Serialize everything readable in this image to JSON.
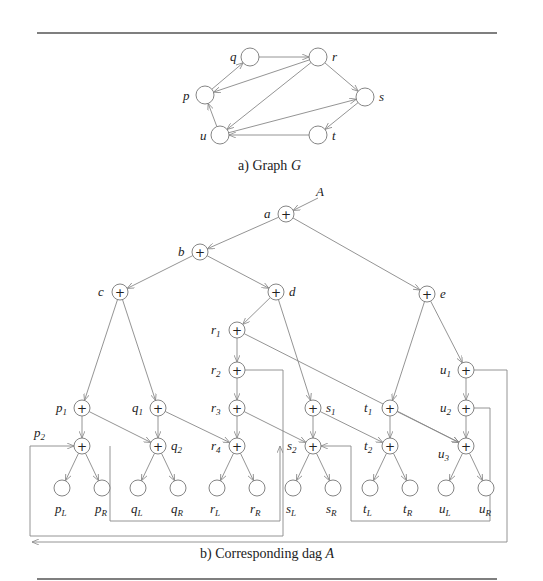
{
  "figure_a": {
    "caption_prefix": "a) Graph ",
    "caption_var": "G",
    "nodes": [
      {
        "id": "p",
        "label": "p",
        "x": 205,
        "y": 95,
        "lx": -22,
        "ly": 5
      },
      {
        "id": "q",
        "label": "q",
        "x": 250,
        "y": 57,
        "lx": -20,
        "ly": 4
      },
      {
        "id": "r",
        "label": "r",
        "x": 318,
        "y": 57,
        "lx": 14,
        "ly": 4
      },
      {
        "id": "s",
        "label": "s",
        "x": 365,
        "y": 97,
        "lx": 14,
        "ly": 4
      },
      {
        "id": "t",
        "label": "t",
        "x": 318,
        "y": 135,
        "lx": 14,
        "ly": 5
      },
      {
        "id": "u",
        "label": "u",
        "x": 220,
        "y": 135,
        "lx": -20,
        "ly": 5
      }
    ],
    "edges": [
      [
        "p",
        "q"
      ],
      [
        "q",
        "r"
      ],
      [
        "r",
        "p"
      ],
      [
        "r",
        "s"
      ],
      [
        "r",
        "u"
      ],
      [
        "u",
        "p"
      ],
      [
        "u",
        "s"
      ],
      [
        "s",
        "t"
      ],
      [
        "t",
        "u"
      ]
    ]
  },
  "figure_b": {
    "caption_prefix": "b) Corresponding dag ",
    "caption_var": "A",
    "root_pointer": "A",
    "op_nodes": [
      {
        "id": "a",
        "label": "a",
        "x": 286,
        "y": 214,
        "side": "left"
      },
      {
        "id": "b",
        "label": "b",
        "x": 200,
        "y": 252,
        "side": "left"
      },
      {
        "id": "c",
        "label": "c",
        "x": 120,
        "y": 292,
        "side": "left"
      },
      {
        "id": "d",
        "label": "d",
        "x": 276,
        "y": 292,
        "side": "right"
      },
      {
        "id": "e",
        "label": "e",
        "x": 427,
        "y": 294,
        "side": "right"
      },
      {
        "id": "r1",
        "label": "r",
        "sub": "1",
        "x": 237,
        "y": 330,
        "side": "left"
      },
      {
        "id": "r2",
        "label": "r",
        "sub": "2",
        "x": 237,
        "y": 370,
        "side": "left"
      },
      {
        "id": "r3",
        "label": "r",
        "sub": "3",
        "x": 237,
        "y": 408,
        "side": "left"
      },
      {
        "id": "r4",
        "label": "r",
        "sub": "4",
        "x": 237,
        "y": 446,
        "side": "left"
      },
      {
        "id": "p1",
        "label": "p",
        "sub": "1",
        "x": 82,
        "y": 408,
        "side": "left"
      },
      {
        "id": "p2",
        "label": "p",
        "sub": "2",
        "x": 82,
        "y": 446,
        "side": "topleft"
      },
      {
        "id": "q1",
        "label": "q",
        "sub": "1",
        "x": 158,
        "y": 408,
        "side": "left"
      },
      {
        "id": "q2",
        "label": "q",
        "sub": "2",
        "x": 158,
        "y": 446,
        "side": "right"
      },
      {
        "id": "s1",
        "label": "s",
        "sub": "1",
        "x": 313,
        "y": 408,
        "side": "right"
      },
      {
        "id": "s2",
        "label": "s",
        "sub": "2",
        "x": 313,
        "y": 446,
        "side": "left"
      },
      {
        "id": "t1",
        "label": "t",
        "sub": "1",
        "x": 390,
        "y": 408,
        "side": "left"
      },
      {
        "id": "t2",
        "label": "t",
        "sub": "2",
        "x": 390,
        "y": 446,
        "side": "left"
      },
      {
        "id": "u1",
        "label": "u",
        "sub": "1",
        "x": 466,
        "y": 370,
        "side": "left"
      },
      {
        "id": "u2",
        "label": "u",
        "sub": "2",
        "x": 466,
        "y": 408,
        "side": "left"
      },
      {
        "id": "u3",
        "label": "u",
        "sub": "3",
        "x": 466,
        "y": 446,
        "side": "bottomleft"
      }
    ],
    "leaves": [
      {
        "label": "p",
        "sub": "L",
        "x": 62,
        "y": 488
      },
      {
        "label": "p",
        "sub": "R",
        "x": 102,
        "y": 488
      },
      {
        "label": "q",
        "sub": "L",
        "x": 138,
        "y": 488
      },
      {
        "label": "q",
        "sub": "R",
        "x": 178,
        "y": 488
      },
      {
        "label": "r",
        "sub": "L",
        "x": 217,
        "y": 488
      },
      {
        "label": "r",
        "sub": "R",
        "x": 257,
        "y": 488
      },
      {
        "label": "s",
        "sub": "L",
        "x": 293,
        "y": 488
      },
      {
        "label": "s",
        "sub": "R",
        "x": 333,
        "y": 488
      },
      {
        "label": "t",
        "sub": "L",
        "x": 370,
        "y": 488
      },
      {
        "label": "t",
        "sub": "R",
        "x": 410,
        "y": 488
      },
      {
        "label": "u",
        "sub": "L",
        "x": 446,
        "y": 488
      },
      {
        "label": "u",
        "sub": "R",
        "x": 486,
        "y": 488
      }
    ],
    "tree_edges": [
      [
        "a",
        "b"
      ],
      [
        "a",
        "e"
      ],
      [
        "b",
        "c"
      ],
      [
        "b",
        "d"
      ],
      [
        "c",
        "p1"
      ],
      [
        "c",
        "q1"
      ],
      [
        "d",
        "r1"
      ],
      [
        "d",
        "s1"
      ],
      [
        "e",
        "t1"
      ],
      [
        "e",
        "u1"
      ],
      [
        "r1",
        "r2"
      ],
      [
        "r2",
        "r3"
      ],
      [
        "r3",
        "r4"
      ],
      [
        "p1",
        "p2"
      ],
      [
        "p1",
        "q2"
      ],
      [
        "q1",
        "q2"
      ],
      [
        "q1",
        "r4"
      ],
      [
        "r3",
        "s2"
      ],
      [
        "s1",
        "s2"
      ],
      [
        "s1",
        "t2"
      ],
      [
        "t1",
        "t2"
      ],
      [
        "t1",
        "u3"
      ],
      [
        "u1",
        "u2"
      ],
      [
        "u2",
        "u3"
      ],
      [
        "r1",
        "u3"
      ]
    ],
    "back_edges": [
      {
        "from": "r2",
        "to": "p2",
        "path": "M245,370 L283,370 L283,536 L30,536 L30,446 L74,446"
      },
      {
        "from": "p2",
        "to": "p1",
        "path": "M110,446 L110,521 L280,521 L280,446"
      },
      {
        "from": "u2",
        "to": "s2",
        "path": "M474,408 L490,408 L490,521 L351,521 L351,446 L321,446"
      },
      {
        "from": "u1",
        "to": "r2?",
        "path": "M474,370 L507,370 L507,542 L32,542"
      }
    ]
  }
}
